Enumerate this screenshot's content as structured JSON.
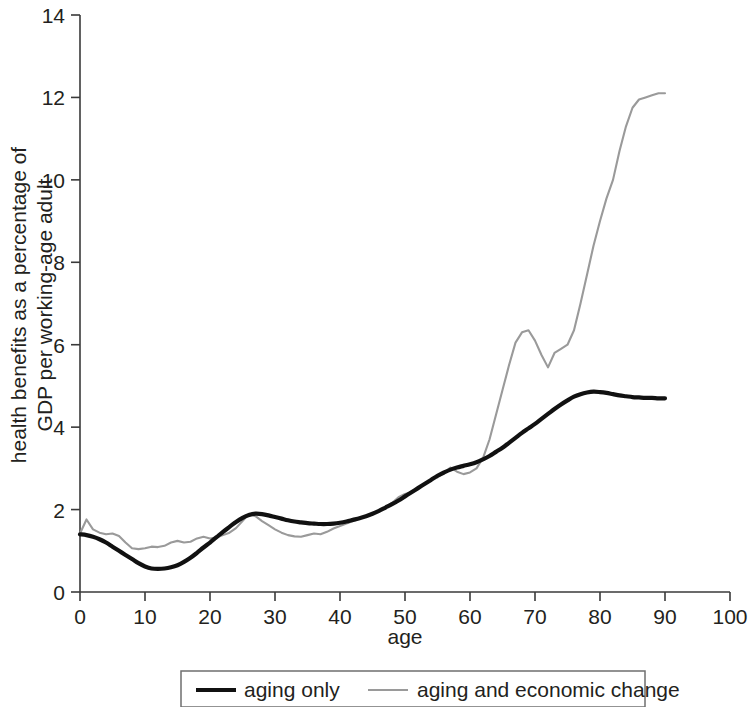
{
  "chart_data": {
    "type": "line",
    "title": "",
    "xlabel": "age",
    "ylabel": "health benefits as a percentage of GDP per working-age adult",
    "ylabel_line1": "health benefits as a percentage of",
    "ylabel_line2": "GDP per working-age adult",
    "xlim": [
      0,
      100
    ],
    "ylim": [
      0,
      14
    ],
    "xticks": [
      0,
      10,
      20,
      30,
      40,
      50,
      60,
      70,
      80,
      90,
      100
    ],
    "yticks": [
      0,
      2,
      4,
      6,
      8,
      10,
      12,
      14
    ],
    "xtick_labels": [
      "0",
      "10",
      "20",
      "30",
      "40",
      "50",
      "60",
      "70",
      "80",
      "90",
      "100"
    ],
    "ytick_labels": [
      "0",
      "2",
      "4",
      "6",
      "8",
      "10",
      "12",
      "14"
    ],
    "grid": false,
    "legend_position": "bottom",
    "colors": {
      "aging_only": "#111111",
      "aging_and_economic_change": "#9a9a9a",
      "axis": "#3a3a3a",
      "text": "#231f20"
    },
    "series": [
      {
        "name": "aging only",
        "color": "#111111",
        "x": [
          0,
          1,
          2,
          3,
          4,
          5,
          6,
          7,
          8,
          9,
          10,
          11,
          12,
          13,
          14,
          15,
          16,
          17,
          18,
          19,
          20,
          21,
          22,
          23,
          24,
          25,
          26,
          27,
          28,
          29,
          30,
          31,
          32,
          33,
          34,
          35,
          36,
          37,
          38,
          39,
          40,
          41,
          42,
          43,
          44,
          45,
          46,
          47,
          48,
          49,
          50,
          51,
          52,
          53,
          54,
          55,
          56,
          57,
          58,
          59,
          60,
          61,
          62,
          63,
          64,
          65,
          66,
          67,
          68,
          69,
          70,
          71,
          72,
          73,
          74,
          75,
          76,
          77,
          78,
          79,
          80,
          81,
          82,
          83,
          84,
          85,
          86,
          87,
          88,
          89,
          90
        ],
        "values": [
          1.4,
          1.38,
          1.34,
          1.28,
          1.2,
          1.1,
          1.0,
          0.9,
          0.8,
          0.7,
          0.62,
          0.57,
          0.56,
          0.57,
          0.6,
          0.65,
          0.73,
          0.83,
          0.95,
          1.08,
          1.2,
          1.33,
          1.46,
          1.58,
          1.7,
          1.8,
          1.87,
          1.9,
          1.89,
          1.86,
          1.82,
          1.78,
          1.74,
          1.71,
          1.69,
          1.67,
          1.66,
          1.65,
          1.65,
          1.66,
          1.68,
          1.71,
          1.75,
          1.79,
          1.84,
          1.9,
          1.97,
          2.05,
          2.13,
          2.22,
          2.32,
          2.42,
          2.52,
          2.62,
          2.72,
          2.82,
          2.9,
          2.97,
          3.02,
          3.06,
          3.1,
          3.15,
          3.22,
          3.3,
          3.4,
          3.5,
          3.62,
          3.74,
          3.86,
          3.97,
          4.08,
          4.2,
          4.32,
          4.44,
          4.55,
          4.65,
          4.74,
          4.8,
          4.84,
          4.86,
          4.85,
          4.83,
          4.8,
          4.77,
          4.75,
          4.73,
          4.72,
          4.71,
          4.71,
          4.7,
          4.7
        ]
      },
      {
        "name": "aging and economic change",
        "color": "#9a9a9a",
        "x": [
          0,
          1,
          2,
          3,
          4,
          5,
          6,
          7,
          8,
          9,
          10,
          11,
          12,
          13,
          14,
          15,
          16,
          17,
          18,
          19,
          20,
          21,
          22,
          23,
          24,
          25,
          26,
          27,
          28,
          29,
          30,
          31,
          32,
          33,
          34,
          35,
          36,
          37,
          38,
          39,
          40,
          41,
          42,
          43,
          44,
          45,
          46,
          47,
          48,
          49,
          50,
          51,
          52,
          53,
          54,
          55,
          56,
          57,
          58,
          59,
          60,
          61,
          62,
          63,
          64,
          65,
          66,
          67,
          68,
          69,
          70,
          71,
          72,
          73,
          74,
          75,
          76,
          77,
          78,
          79,
          80,
          81,
          82,
          83,
          84,
          85,
          86,
          87,
          88,
          89,
          90
        ],
        "values": [
          1.42,
          1.76,
          1.52,
          1.44,
          1.4,
          1.42,
          1.36,
          1.2,
          1.06,
          1.04,
          1.06,
          1.1,
          1.09,
          1.12,
          1.2,
          1.24,
          1.2,
          1.22,
          1.3,
          1.34,
          1.3,
          1.32,
          1.38,
          1.44,
          1.55,
          1.72,
          1.9,
          1.84,
          1.72,
          1.62,
          1.52,
          1.44,
          1.38,
          1.35,
          1.34,
          1.38,
          1.42,
          1.4,
          1.46,
          1.54,
          1.6,
          1.66,
          1.72,
          1.78,
          1.84,
          1.9,
          1.98,
          2.05,
          2.16,
          2.3,
          2.38,
          2.42,
          2.5,
          2.62,
          2.72,
          2.78,
          2.9,
          3.02,
          2.92,
          2.86,
          2.9,
          3.0,
          3.25,
          3.7,
          4.3,
          4.9,
          5.5,
          6.05,
          6.3,
          6.35,
          6.1,
          5.75,
          5.45,
          5.8,
          5.9,
          6.0,
          6.35,
          7.0,
          7.7,
          8.4,
          9.0,
          9.55,
          10.0,
          10.7,
          11.3,
          11.75,
          11.95,
          12.0,
          12.05,
          12.1,
          12.1
        ]
      }
    ],
    "legend": [
      {
        "label": "aging only",
        "style": "thick-black"
      },
      {
        "label": "aging and economic change",
        "style": "thin-gray"
      }
    ]
  }
}
